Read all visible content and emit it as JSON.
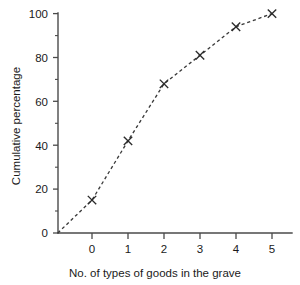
{
  "chart_data": {
    "type": "line",
    "title": "",
    "subtitle": "",
    "xlabel": "No. of types of goods in the grave",
    "ylabel": "Cumulative percentage",
    "x": [
      0,
      1,
      2,
      3,
      4,
      5
    ],
    "values": [
      15,
      42,
      68,
      81,
      94,
      100
    ],
    "series": [
      {
        "name": "Cumulative percentage",
        "values": [
          15,
          42,
          68,
          81,
          94,
          100
        ]
      }
    ],
    "origin_point": {
      "x": -0.95,
      "y": 0,
      "note": "dashed line begins at the y-axis baseline left of x = 0"
    },
    "xlim": [
      -0.95,
      5.3
    ],
    "ylim": [
      0,
      104
    ],
    "xticks": [
      0,
      1,
      2,
      3,
      4,
      5
    ],
    "xtick_labels": [
      "0",
      "1",
      "2",
      "3",
      "4",
      "5"
    ],
    "yticks": [
      0,
      20,
      40,
      60,
      80,
      100
    ],
    "ytick_labels": [
      "0",
      "20",
      "40",
      "60",
      "80",
      "100"
    ],
    "yticks_minor": [
      10,
      30,
      50,
      70,
      90
    ],
    "grid": false,
    "legend": false,
    "legend_position": "none",
    "marker_style": "x",
    "line_style": "dashed",
    "line_color": "#3a3a3a",
    "marker_color": "#2b2b2b",
    "axis_color": "#4a4a4a",
    "background_color": "#ffffff"
  }
}
